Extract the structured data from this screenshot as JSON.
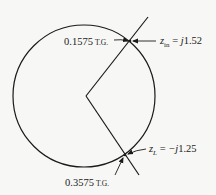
{
  "diagram": {
    "type": "smith-chart-construction",
    "circle": {
      "cx": 84,
      "cy": 96,
      "r": 71
    },
    "vertex": {
      "x": 86,
      "y": 96
    },
    "lines": [
      {
        "name": "upper-radial-line",
        "from": [
          86,
          96
        ],
        "to": [
          148,
          17
        ]
      },
      {
        "name": "lower-radial-line",
        "from": [
          86,
          96
        ],
        "to": [
          139,
          175
        ]
      }
    ],
    "points": {
      "input": {
        "x": 130,
        "y": 41
      },
      "load": {
        "x": 125,
        "y": 155
      }
    }
  },
  "labels": {
    "input_tg": {
      "value": "0.1575",
      "unit": "T.G."
    },
    "input_impedance": {
      "symbol": "z",
      "subscript": "in",
      "equals": " = ",
      "value_prefix": "j",
      "value": "1.52"
    },
    "load_impedance": {
      "symbol": "z",
      "subscript": "L",
      "equals": " = ",
      "value_prefix": "−j",
      "value": "1.25"
    },
    "load_tg": {
      "value": "0.3575",
      "unit": "T.G."
    }
  },
  "colors": {
    "ink": "#1a1a1a",
    "background": "#f7f7f5"
  }
}
